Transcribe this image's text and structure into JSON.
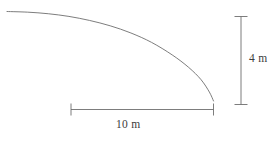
{
  "figure": {
    "background_color": "#ffffff",
    "line_color": "#6e6e6e",
    "text_color": "#3c3c3c",
    "width": 275,
    "height": 143
  },
  "dimensions": {
    "vertical": {
      "label": "4 m",
      "value": 4,
      "unit": "m",
      "orientation": "vertical"
    },
    "horizontal": {
      "label": "10 m",
      "value": 10,
      "unit": "m",
      "orientation": "horizontal"
    }
  },
  "chart_data": {
    "type": "line",
    "title": "",
    "xlabel": "",
    "ylabel": "",
    "xlim": [
      0,
      10
    ],
    "ylim": [
      0,
      4
    ],
    "grid": false,
    "legend": null,
    "annotations": [
      {
        "text": "4 m",
        "axis": "y",
        "span": [
          0,
          4
        ]
      },
      {
        "text": "10 m",
        "axis": "x",
        "span": [
          0,
          10
        ]
      }
    ],
    "series": [
      {
        "name": "profile-curve",
        "x": [
          0.0,
          1.0,
          2.0,
          3.0,
          4.0,
          5.0,
          6.0,
          7.0,
          8.0,
          8.8,
          9.4,
          9.8,
          10.0
        ],
        "y": [
          4.0,
          3.97,
          3.9,
          3.78,
          3.6,
          3.36,
          3.04,
          2.62,
          2.06,
          1.5,
          0.95,
          0.4,
          0.0
        ]
      }
    ]
  }
}
